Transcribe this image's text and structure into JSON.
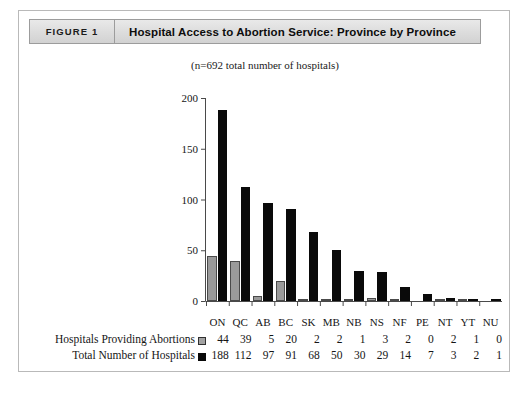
{
  "header": {
    "tag": "FIGURE 1",
    "title": "Hospital Access to Abortion Service: Province by Province"
  },
  "chart_data": {
    "type": "bar",
    "title": "Hospital Access to Abortion Service: Province by Province",
    "subtitle": "(n=692 total number of hospitals)",
    "xlabel": "",
    "ylabel": "",
    "ylim": [
      0,
      200
    ],
    "yticks": [
      0,
      50,
      100,
      150,
      200
    ],
    "grid": false,
    "legend_position": "bottom-table",
    "categories": [
      "ON",
      "QC",
      "AB",
      "BC",
      "SK",
      "MB",
      "NB",
      "NS",
      "NF",
      "PE",
      "NT",
      "YT",
      "NU"
    ],
    "series": [
      {
        "name": "Hospitals Providing Abortions",
        "color": "#9a9a9a",
        "marker": "gray-square",
        "values": [
          44,
          39,
          5,
          20,
          2,
          2,
          1,
          3,
          2,
          0,
          2,
          1,
          0
        ]
      },
      {
        "name": "Total Number of Hospitals",
        "color": "#0a0a0a",
        "marker": "black-square",
        "values": [
          188,
          112,
          97,
          91,
          68,
          50,
          30,
          29,
          14,
          7,
          3,
          2,
          1
        ]
      }
    ]
  },
  "colors": {
    "series_gray": "#9a9a9a",
    "series_black": "#0a0a0a",
    "header_band": "#dcdcdc",
    "frame_border": "#b9b9b9"
  }
}
